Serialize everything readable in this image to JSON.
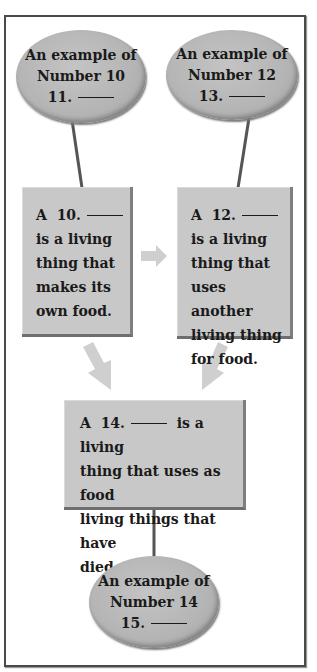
{
  "diagram": {
    "type": "food-web-concept-map",
    "colors": {
      "frame": "#4a4a4a",
      "node_fill": "#c8c8c8",
      "ellipse_fill": "#b4b4b4",
      "connector": "#555555",
      "arrow": "#cfcfcf",
      "text": "#1a1a1a"
    },
    "ellipses": [
      {
        "id": "example-10",
        "line1": "An example of",
        "line2": "Number 10",
        "number": "11."
      },
      {
        "id": "example-12",
        "line1": "An example of",
        "line2": "Number 12",
        "number": "13."
      },
      {
        "id": "example-14",
        "line1": "An example of",
        "line2": "Number 14",
        "number": "15."
      }
    ],
    "boxes": [
      {
        "id": "producer",
        "prefix": "A",
        "number": "10.",
        "lines": [
          "is a living",
          "thing that",
          "makes its",
          "own food."
        ]
      },
      {
        "id": "consumer",
        "prefix": "A",
        "number": "12.",
        "lines": [
          "is a living",
          "thing that",
          "uses another",
          "living thing",
          "for food."
        ]
      },
      {
        "id": "decomposer",
        "prefix": "A",
        "number": "14.",
        "first_line_suffix": "is a living",
        "lines": [
          "thing that uses as food",
          "living things that have",
          "died."
        ]
      }
    ],
    "arrows": [
      {
        "from": "producer",
        "to": "consumer",
        "direction": "right"
      },
      {
        "from": "producer",
        "to": "decomposer",
        "direction": "down-right"
      },
      {
        "from": "consumer",
        "to": "decomposer",
        "direction": "down-left"
      }
    ],
    "connectors": [
      {
        "from": "example-10",
        "to": "producer"
      },
      {
        "from": "example-12",
        "to": "consumer"
      },
      {
        "from": "decomposer",
        "to": "example-14"
      }
    ]
  }
}
